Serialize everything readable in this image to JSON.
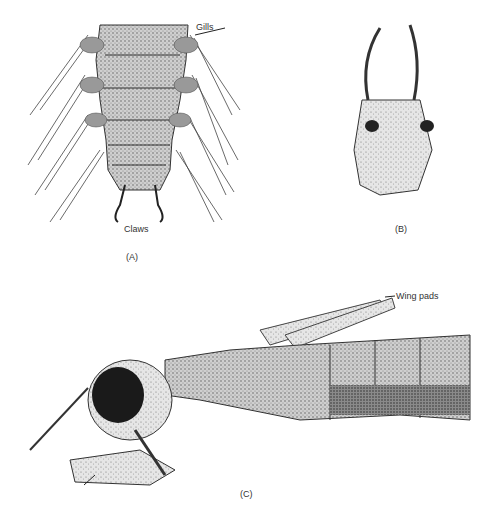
{
  "figure": {
    "panels": [
      {
        "id": "A",
        "caption": "(A)",
        "labels": [
          {
            "text": "Gills"
          },
          {
            "text": "Claws"
          }
        ]
      },
      {
        "id": "B",
        "caption": "(B)",
        "labels": []
      },
      {
        "id": "C",
        "caption": "(C)",
        "labels": [
          {
            "text": "Wing pads"
          }
        ]
      }
    ]
  }
}
